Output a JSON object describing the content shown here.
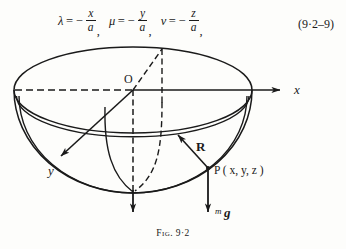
{
  "equation": {
    "terms": [
      {
        "symbol": "λ",
        "eq": "=",
        "minus": "−",
        "numerator": "x",
        "denominator": "a",
        "comma": ","
      },
      {
        "symbol": "μ",
        "eq": "=",
        "minus": "−",
        "numerator": "y",
        "denominator": "a",
        "comma": ","
      },
      {
        "symbol": "ν",
        "eq": "=",
        "minus": "−",
        "numerator": "z",
        "denominator": "a",
        "comma": ","
      }
    ],
    "number": "(9·2–9)"
  },
  "figure": {
    "caption_prefix": "Fig.",
    "caption_number": "9·2",
    "origin_label": "O",
    "axes": [
      {
        "name": "x-axis",
        "label": "x"
      },
      {
        "name": "y-axis",
        "label": "y"
      },
      {
        "name": "z-axis",
        "label": "z"
      }
    ],
    "point_label": "P ( x, y, z )",
    "reaction_label": "R",
    "weight_label_mass": "m",
    "weight_label_gravity": "g",
    "stroke_color": "#1a1a1a"
  }
}
